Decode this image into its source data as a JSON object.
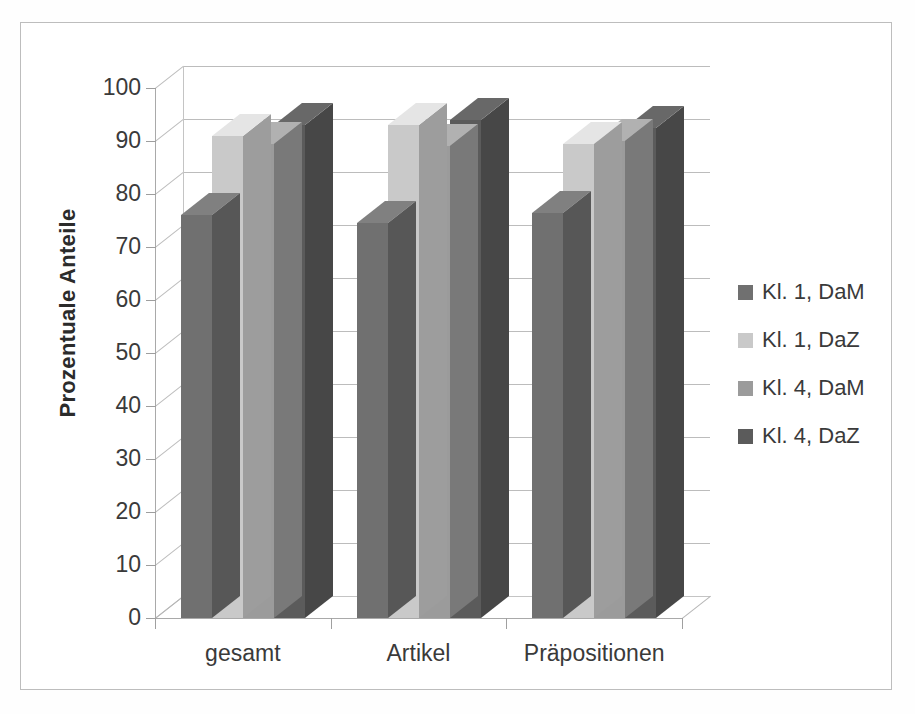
{
  "chart_data": {
    "type": "bar",
    "title": "",
    "subtitle": "",
    "xlabel": "",
    "ylabel": "Prozentuale Anteile",
    "ylim": [
      0,
      100
    ],
    "ytick_step": 10,
    "yticks": [
      "100",
      "90",
      "80",
      "70",
      "60",
      "50",
      "40",
      "30",
      "20",
      "10",
      "0"
    ],
    "grid": true,
    "three_d": true,
    "legend_position": "right",
    "categories": [
      "gesamt",
      "Artikel",
      "Präpositionen"
    ],
    "series": [
      {
        "name": "Kl. 1, DaM",
        "color": "#707070",
        "values": [
          76,
          74.5,
          76.5
        ]
      },
      {
        "name": "Kl. 1, DaZ",
        "color": "#c9c9c9",
        "values": [
          91,
          93,
          89.5
        ]
      },
      {
        "name": "Kl. 4, DaM",
        "color": "#9b9b9b",
        "values": [
          89.5,
          89,
          90
        ]
      },
      {
        "name": "Kl. 4, DaZ",
        "color": "#5b5b5b",
        "values": [
          93,
          94,
          92.5
        ]
      }
    ]
  },
  "legend": {
    "items": [
      {
        "label": "Kl. 1, DaM",
        "color": "#707070"
      },
      {
        "label": "Kl. 1, DaZ",
        "color": "#c9c9c9"
      },
      {
        "label": "Kl. 4, DaM",
        "color": "#9b9b9b"
      },
      {
        "label": "Kl. 4, DaZ",
        "color": "#5b5b5b"
      }
    ]
  },
  "axes": {
    "y_title": "Prozentuale Anteile",
    "y_tick_labels": [
      "100",
      "90",
      "80",
      "70",
      "60",
      "50",
      "40",
      "30",
      "20",
      "10",
      "0"
    ],
    "x_tick_labels": [
      "gesamt",
      "Artikel",
      "Präpositionen"
    ]
  },
  "colors": {
    "frame": "#bdbdbd",
    "grid": "#bcbcbc",
    "axis": "#a9a9a9",
    "text": "#3a3a3a",
    "background": "#ffffff"
  }
}
